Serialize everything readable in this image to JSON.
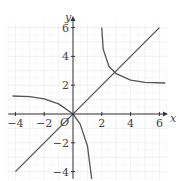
{
  "chart_data": {
    "type": "line",
    "title": "",
    "xlabel": "x",
    "ylabel": "y",
    "xlim": [
      -4.5,
      6.5
    ],
    "ylim": [
      -4.5,
      6.5
    ],
    "grid": true,
    "x_ticks": [
      "-4",
      "-2",
      "2",
      "4",
      "6"
    ],
    "y_ticks": [
      "6",
      "4",
      "2",
      "-2",
      "-4"
    ],
    "origin_label": "O",
    "series": [
      {
        "name": "line y = x",
        "points": [
          [
            -4,
            -4
          ],
          [
            6,
            6
          ]
        ]
      },
      {
        "name": "curve through origin (left branch)",
        "points": [
          [
            -4.2,
            1.25
          ],
          [
            -3,
            1.2
          ],
          [
            -2,
            1.05
          ],
          [
            -1,
            0.7
          ],
          [
            0,
            0
          ],
          [
            0.5,
            -0.7
          ],
          [
            1,
            -2.2
          ],
          [
            1.3,
            -4.5
          ]
        ]
      },
      {
        "name": "curve right branch",
        "points": [
          [
            2,
            6
          ],
          [
            2.1,
            4.5
          ],
          [
            2.5,
            3.3
          ],
          [
            3,
            2.8
          ],
          [
            4,
            2.35
          ],
          [
            5,
            2.2
          ],
          [
            6.4,
            2.15
          ]
        ]
      }
    ]
  }
}
